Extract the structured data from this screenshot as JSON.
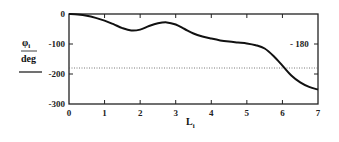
{
  "chart_data": {
    "type": "line",
    "title": "",
    "xlabel": "L",
    "xlabel_subscript": "i",
    "ylabel_numerator": "φ",
    "ylabel_subscript": "i",
    "ylabel_denominator": "deg",
    "xlim": [
      0,
      7
    ],
    "ylim": [
      -300,
      0
    ],
    "x_ticks": [
      0,
      1,
      2,
      3,
      4,
      5,
      6,
      7
    ],
    "x_tick_labels": [
      "0",
      "1",
      "2",
      "3",
      "4",
      "5",
      "6",
      "7"
    ],
    "y_ticks": [
      0,
      -100,
      -200,
      -300
    ],
    "y_tick_labels": [
      "0",
      "-100",
      "-200",
      "-300"
    ],
    "right_axis_label": "- 180",
    "grid": false,
    "reference_line": {
      "y": -180,
      "style": "dotted"
    },
    "series": [
      {
        "name": "phi_i",
        "x": [
          0,
          0.25,
          0.5,
          0.75,
          1.0,
          1.25,
          1.5,
          1.75,
          2.0,
          2.25,
          2.5,
          2.75,
          3.0,
          3.25,
          3.5,
          3.75,
          4.0,
          4.25,
          4.5,
          4.75,
          5.0,
          5.25,
          5.5,
          5.75,
          6.0,
          6.25,
          6.5,
          6.75,
          7.0
        ],
        "y": [
          0,
          -2,
          -6,
          -13,
          -22,
          -34,
          -47,
          -55,
          -52,
          -40,
          -31,
          -28,
          -35,
          -50,
          -65,
          -75,
          -82,
          -88,
          -92,
          -95,
          -98,
          -104,
          -115,
          -140,
          -172,
          -205,
          -228,
          -243,
          -252
        ]
      }
    ]
  }
}
